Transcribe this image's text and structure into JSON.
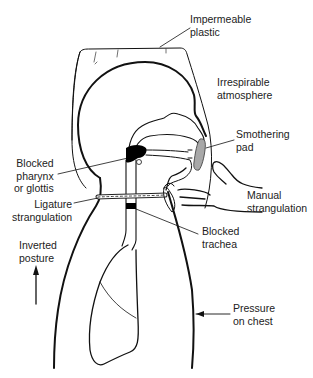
{
  "figure": {
    "type": "anatomical-schematic",
    "labels": {
      "impermeable_plastic": "Impermeable\nplastic",
      "irrespirable_atmosphere": "Irrespirable\natmosphere",
      "smothering_pad": "Smothering\npad",
      "blocked_pharynx": "Blocked\npharynx\nor glottis",
      "manual_strangulation": "Manual\nstrangulation",
      "ligature_strangulation": "Ligature\nstrangulation",
      "blocked_trachea": "Blocked\ntrachea",
      "inverted_posture": "Inverted\nposture",
      "pressure_on_chest": "Pressure\non chest"
    },
    "colors": {
      "line": "#111111",
      "pad_fill": "#a8a8a8",
      "blockage_fill": "#000000",
      "background": "#ffffff"
    }
  }
}
